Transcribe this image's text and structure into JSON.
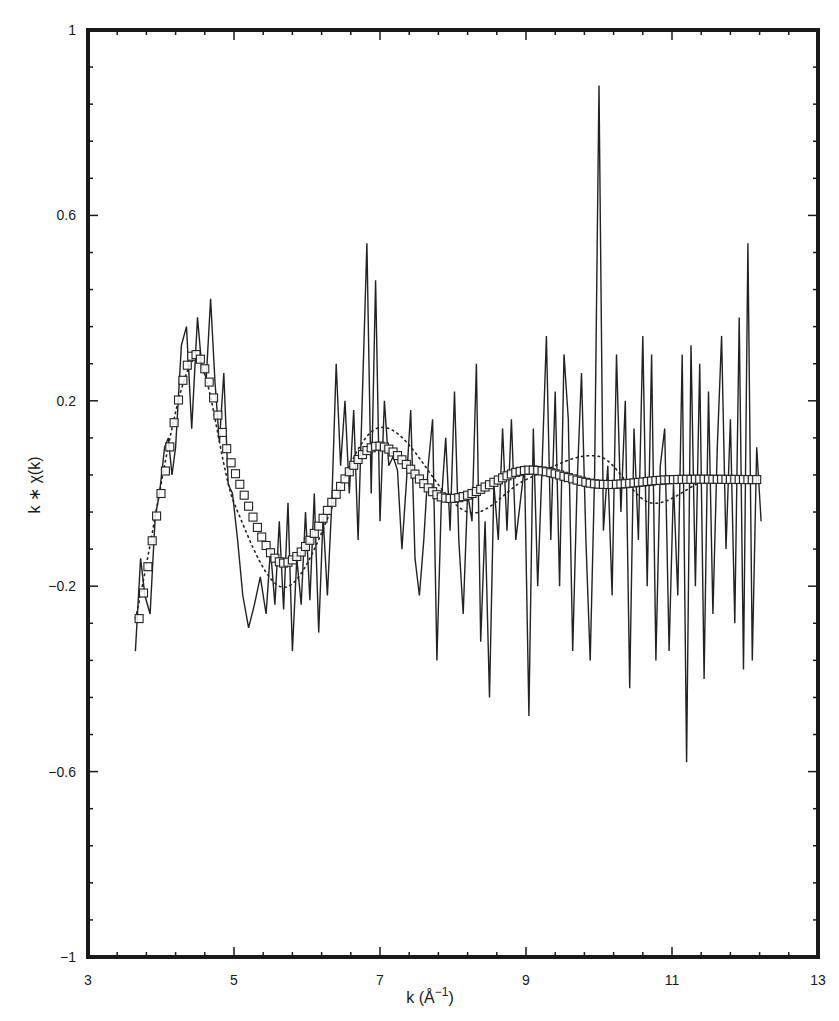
{
  "chart_data": {
    "type": "line",
    "title": "",
    "xlabel": "k (Å⁻¹)",
    "ylabel": "k * χ(k)",
    "xlim": [
      3,
      13
    ],
    "ylim": [
      -1,
      1
    ],
    "x_ticks": [
      3,
      5,
      7,
      9,
      11,
      13
    ],
    "x_tick_labels": [
      "3",
      "5",
      "7",
      "9",
      "11",
      "13"
    ],
    "y_ticks": [
      1,
      0.6,
      0.2,
      -0.2,
      -0.6,
      -1
    ],
    "y_tick_labels": [
      "1",
      "0.6",
      "0.2",
      "−0.2",
      "−0.6",
      "−1"
    ],
    "grid": false,
    "legend": null,
    "series": [
      {
        "name": "experimental data",
        "style": "solid line",
        "x": [
          3.65,
          3.72,
          3.78,
          3.85,
          3.92,
          3.98,
          4.05,
          4.1,
          4.15,
          4.2,
          4.28,
          4.35,
          4.42,
          4.5,
          4.56,
          4.62,
          4.68,
          4.74,
          4.8,
          4.86,
          4.92,
          4.98,
          5.05,
          5.12,
          5.2,
          5.28,
          5.36,
          5.44,
          5.5,
          5.56,
          5.62,
          5.68,
          5.74,
          5.8,
          5.86,
          5.92,
          5.98,
          6.04,
          6.1,
          6.16,
          6.22,
          6.28,
          6.34,
          6.4,
          6.46,
          6.52,
          6.58,
          6.64,
          6.7,
          6.76,
          6.82,
          6.88,
          6.94,
          7.0,
          7.06,
          7.12,
          7.18,
          7.24,
          7.3,
          7.36,
          7.42,
          7.48,
          7.54,
          7.6,
          7.66,
          7.72,
          7.78,
          7.84,
          7.9,
          7.96,
          8.02,
          8.08,
          8.14,
          8.2,
          8.26,
          8.32,
          8.38,
          8.44,
          8.5,
          8.56,
          8.62,
          8.68,
          8.74,
          8.8,
          8.86,
          8.92,
          8.98,
          9.04,
          9.1,
          9.16,
          9.22,
          9.28,
          9.34,
          9.4,
          9.46,
          9.52,
          9.58,
          9.64,
          9.7,
          9.76,
          9.82,
          9.88,
          9.94,
          10.0,
          10.06,
          10.12,
          10.18,
          10.24,
          10.3,
          10.36,
          10.42,
          10.48,
          10.54,
          10.6,
          10.66,
          10.72,
          10.78,
          10.84,
          10.9,
          10.96,
          11.02,
          11.08,
          11.14,
          11.2,
          11.26,
          11.32,
          11.38,
          11.44,
          11.5,
          11.56,
          11.62,
          11.68,
          11.74,
          11.8,
          11.86,
          11.92,
          11.98,
          12.04,
          12.1,
          12.16,
          12.22
        ],
        "y": [
          -0.34,
          -0.14,
          -0.22,
          -0.26,
          -0.05,
          0.0,
          0.1,
          0.12,
          0.04,
          0.1,
          0.32,
          0.36,
          0.14,
          0.38,
          0.27,
          0.25,
          0.42,
          0.24,
          0.11,
          0.26,
          0.02,
          0.0,
          -0.1,
          -0.22,
          -0.29,
          -0.24,
          -0.18,
          -0.26,
          -0.12,
          -0.24,
          -0.06,
          -0.25,
          -0.02,
          -0.34,
          -0.14,
          -0.24,
          -0.04,
          -0.23,
          0.0,
          -0.3,
          -0.05,
          -0.22,
          -0.02,
          0.28,
          0.06,
          0.2,
          0.0,
          0.18,
          -0.1,
          0.22,
          0.54,
          0.0,
          0.46,
          -0.06,
          0.2,
          0.06,
          0.08,
          0.05,
          -0.12,
          0.02,
          0.18,
          -0.14,
          -0.22,
          -0.1,
          0.06,
          0.16,
          -0.36,
          -0.02,
          0.12,
          -0.08,
          0.22,
          -0.1,
          -0.26,
          0.0,
          -0.06,
          0.28,
          -0.32,
          -0.06,
          -0.44,
          0.02,
          -0.1,
          0.14,
          -0.08,
          0.16,
          -0.1,
          -0.02,
          0.06,
          -0.48,
          0.14,
          -0.2,
          0.06,
          0.34,
          -0.1,
          0.22,
          -0.2,
          0.3,
          0.16,
          -0.34,
          0.02,
          0.26,
          -0.1,
          -0.36,
          0.04,
          0.88,
          -0.08,
          0.06,
          -0.22,
          0.3,
          -0.04,
          0.2,
          -0.42,
          0.14,
          -0.1,
          0.34,
          -0.2,
          0.3,
          -0.36,
          0.06,
          0.14,
          -0.34,
          0.02,
          -0.22,
          0.3,
          -0.58,
          0.32,
          -0.2,
          0.28,
          -0.4,
          0.22,
          -0.26,
          0.1,
          0.34,
          -0.12,
          0.16,
          -0.28,
          0.38,
          -0.38,
          0.54,
          -0.36,
          0.1,
          -0.06
        ]
      },
      {
        "name": "fit (squares)",
        "style": "open square markers",
        "model": "damped sinusoid",
        "key_points": [
          {
            "k": 3.7,
            "y": -0.27
          },
          {
            "k": 4.0,
            "y": 0.0
          },
          {
            "k": 4.45,
            "y": 0.3
          },
          {
            "k": 5.0,
            "y": 0.05
          },
          {
            "k": 5.7,
            "y": -0.15
          },
          {
            "k": 6.9,
            "y": 0.1
          },
          {
            "k": 7.9,
            "y": -0.01
          },
          {
            "k": 9.0,
            "y": 0.05
          },
          {
            "k": 10.0,
            "y": 0.02
          },
          {
            "k": 11.0,
            "y": 0.03
          },
          {
            "k": 12.2,
            "y": 0.03
          }
        ]
      },
      {
        "name": "fit (dotted)",
        "style": "dotted line",
        "key_points": [
          {
            "k": 3.65,
            "y": -0.27
          },
          {
            "k": 4.45,
            "y": 0.29
          },
          {
            "k": 5.0,
            "y": -0.02
          },
          {
            "k": 5.75,
            "y": -0.2
          },
          {
            "k": 6.95,
            "y": 0.14
          },
          {
            "k": 8.2,
            "y": -0.04
          },
          {
            "k": 9.0,
            "y": 0.03
          },
          {
            "k": 10.0,
            "y": 0.08
          },
          {
            "k": 10.7,
            "y": -0.02
          },
          {
            "k": 11.5,
            "y": 0.03
          },
          {
            "k": 12.2,
            "y": 0.03
          }
        ]
      }
    ]
  },
  "axes": {
    "x_label_main": "k (Å",
    "x_label_sup": "−1",
    "x_label_close": ")",
    "y_label": "k ∗ χ(k)"
  }
}
